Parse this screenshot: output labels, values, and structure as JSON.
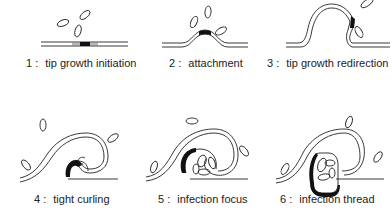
{
  "diagram": {
    "stages": [
      {
        "number": "1 :",
        "label": "tip growth initiation"
      },
      {
        "number": "2 :",
        "label": "attachment"
      },
      {
        "number": "3 :",
        "label": "tip growth redirection"
      },
      {
        "number": "4 :",
        "label": "tight curling"
      },
      {
        "number": "5 :",
        "label": "infection focus"
      },
      {
        "number": "6 :",
        "label": "infection thread"
      }
    ],
    "colors": {
      "line": "#222222",
      "background": "#ffffff",
      "dark_region": "#111111"
    }
  }
}
